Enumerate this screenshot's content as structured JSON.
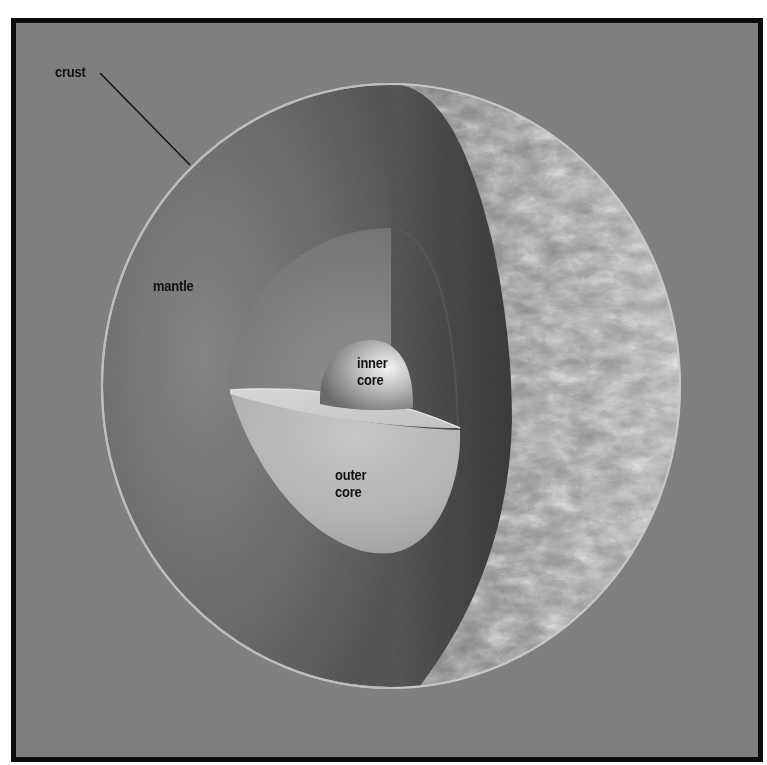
{
  "diagram": {
    "colors": {
      "background": "#7f7f7f",
      "frame_border": "#0d0d0d",
      "mantle_face": "#6e6e6e",
      "cut_wall": "#4f4f4f",
      "outer_core_face": "#8a8a8a",
      "outer_core_bowl": "#bdbdbd",
      "inner_core": "#a8a8a8",
      "crust_rim": "#c8c8c8",
      "surface": "#b5b5b5",
      "label_text": "#111111"
    },
    "labels": [
      {
        "id": "crust",
        "text": "crust",
        "x": 55,
        "y": 63
      },
      {
        "id": "mantle",
        "text": "mantle",
        "x": 153,
        "y": 277
      },
      {
        "id": "inner_core",
        "text": "inner\ncore",
        "x": 357,
        "y": 354
      },
      {
        "id": "outer_core",
        "text": "outer\ncore",
        "x": 335,
        "y": 466
      }
    ],
    "leader_lines": [
      {
        "label": "crust",
        "x1": 100,
        "y1": 73,
        "x2": 190,
        "y2": 165
      }
    ]
  }
}
